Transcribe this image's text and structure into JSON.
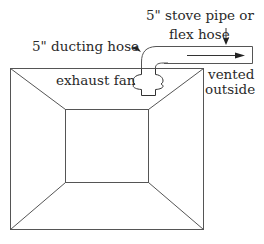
{
  "diagram": {
    "title": "",
    "labels": {
      "stove_pipe_line1": "5\" stove pipe or",
      "stove_pipe_line2": "flex hose",
      "ducting_hose": "5\" ducting hose",
      "exhaust_fan": "exhaust fan",
      "vented_line1": "vented",
      "vented_line2": "outside"
    },
    "components": [
      {
        "id": "hood",
        "shape": "truncated-pyramid box (top view)"
      },
      {
        "id": "exhaust-fan",
        "shape": "fan housing"
      },
      {
        "id": "ducting-hose",
        "shape": "elbow"
      },
      {
        "id": "stove-pipe",
        "shape": "horizontal pipe"
      },
      {
        "id": "flow-arrow",
        "direction": "right"
      }
    ],
    "colors": {
      "line": "#555555",
      "text": "#2a2a2a",
      "background": "#ffffff"
    }
  }
}
